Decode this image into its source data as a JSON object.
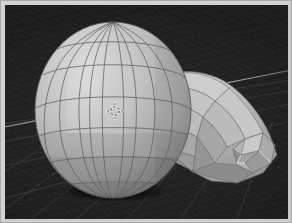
{
  "app": {
    "title": "3D Viewport",
    "mode": "Object Mode",
    "shading": "Solid",
    "view": "User Perspective"
  },
  "viewport": {
    "width": 283,
    "height": 214,
    "background_color": "#232323",
    "grid_color": "#3a3a3a",
    "axis_line_color": "#b9b9b9",
    "object_label": "Sphere-with-extruded-tube",
    "wireframe_color": "#4a4a4a",
    "cursor_label": "3D cursor"
  },
  "palette": {
    "face_highlight": "#d5d5d5",
    "face_light": "#c9c9c9",
    "face_mid": "#bcbcbc",
    "face_base": "#b2b2b2",
    "face_shade": "#a2a2a2",
    "face_dark": "#8f8f8f",
    "face_darker": "#7e7e7e",
    "edge_bright": "#f0f0f0",
    "frame_color": "#d2d2d2",
    "shadow_color": "#101010"
  },
  "geometry": {
    "sphere": {
      "name": "uv-sphere",
      "center_x": 108,
      "center_y": 105,
      "radius_x": 78,
      "radius_y": 88,
      "segments": 12,
      "rings": 8
    },
    "tube": {
      "name": "extruded-tube",
      "segments": 5,
      "description": "curved low-poly extrusion sweeping right and down from the sphere"
    }
  },
  "cursor": {
    "x": 110,
    "y": 106,
    "size": 9
  }
}
